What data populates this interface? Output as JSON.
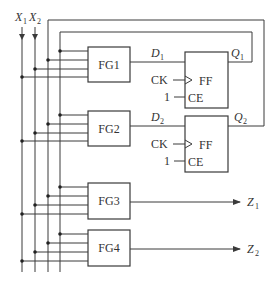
{
  "diagram": {
    "inputs": [
      {
        "name": "X",
        "sub": "1"
      },
      {
        "name": "X",
        "sub": "2"
      }
    ],
    "function_generators": [
      {
        "label": "FG1"
      },
      {
        "label": "FG2"
      },
      {
        "label": "FG3"
      },
      {
        "label": "FG4"
      }
    ],
    "flip_flops": [
      {
        "label": "FF",
        "clock": "CK",
        "enable": "CE",
        "enable_value": "1",
        "d": {
          "name": "D",
          "sub": "1"
        },
        "q": {
          "name": "Q",
          "sub": "1"
        }
      },
      {
        "label": "FF",
        "clock": "CK",
        "enable": "CE",
        "enable_value": "1",
        "d": {
          "name": "D",
          "sub": "2"
        },
        "q": {
          "name": "Q",
          "sub": "2"
        }
      }
    ],
    "outputs": [
      {
        "name": "Z",
        "sub": "1"
      },
      {
        "name": "Z",
        "sub": "2"
      }
    ],
    "colors": {
      "line": "#3a3a3a",
      "text": "#333333",
      "background": "#ffffff"
    }
  }
}
